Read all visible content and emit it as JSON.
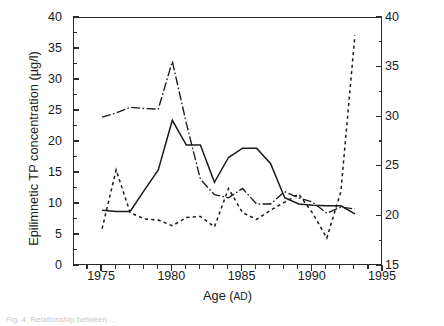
{
  "figure": {
    "caption_partial": "Fig. 4.  Relationship between ..."
  },
  "chart_data": {
    "type": "line",
    "title": "",
    "xlabel": "Age (AD)",
    "xlabel_main": "Age (",
    "xlabel_smallcaps": "AD",
    "xlabel_close": ")",
    "ylabel": "Epilimnetic TP concentration (µg/l)",
    "ylabel_right": "Sediment P concentration (mg/g dry wt)",
    "xlim": [
      1973,
      1995
    ],
    "ylim": [
      0,
      40
    ],
    "ylim_right": [
      15,
      40
    ],
    "grid": false,
    "legend": "none",
    "xticks": [
      1975,
      1980,
      1985,
      1990,
      1995
    ],
    "xticks_minor_step": 1,
    "yticks_left": [
      0,
      5,
      10,
      15,
      20,
      25,
      30,
      35,
      40
    ],
    "yticks_left_minor_step": 2.5,
    "yticks_right": [
      15,
      20,
      25,
      30,
      35,
      40
    ],
    "yticks_right_minor_step": 2.5,
    "series": [
      {
        "name": "Epilimnetic TP (monitored)",
        "axis": "left",
        "style": "solid",
        "color": "#1a1a1a",
        "x": [
          1975,
          1976,
          1977,
          1978,
          1979,
          1980,
          1981,
          1982,
          1983,
          1984,
          1985,
          1986,
          1987,
          1988,
          1989,
          1990,
          1991,
          1992,
          1993
        ],
        "values": [
          9.0,
          8.8,
          8.8,
          12.2,
          15.5,
          23.5,
          19.5,
          19.5,
          13.5,
          17.5,
          19.0,
          19.0,
          16.5,
          11.0,
          10.0,
          9.8,
          9.7,
          9.7,
          8.4
        ]
      },
      {
        "name": "Epilimnetic TP (diatom-inferred)",
        "axis": "left",
        "style": "dash-dot",
        "color": "#1a1a1a",
        "x": [
          1975,
          1976,
          1977,
          1978,
          1979,
          1980,
          1981,
          1982,
          1983,
          1984,
          1985,
          1986,
          1987,
          1988,
          1989,
          1990,
          1991,
          1992,
          1993
        ],
        "values": [
          24.0,
          24.7,
          25.6,
          25.4,
          25.3,
          33.0,
          23.0,
          14.0,
          11.5,
          11.0,
          12.5,
          10.0,
          10.0,
          12.0,
          11.0,
          10.3,
          8.5,
          9.5,
          9.2
        ]
      },
      {
        "name": "Sediment P",
        "axis": "right",
        "style": "dotted",
        "color": "#1a1a1a",
        "x": [
          1975,
          1976,
          1977,
          1978,
          1979,
          1980,
          1981,
          1982,
          1983,
          1984,
          1985,
          1986,
          1987,
          1988,
          1989,
          1990,
          1991,
          1992,
          1993
        ],
        "values_left_scale": [
          6.0,
          15.5,
          8.6,
          7.6,
          7.4,
          6.5,
          7.8,
          8.0,
          6.3,
          12.5,
          8.6,
          7.5,
          9.0,
          10.3,
          11.6,
          8.5,
          4.5,
          12.0,
          37.2
        ],
        "values": [
          18.75,
          24.69,
          20.38,
          19.75,
          19.63,
          19.06,
          19.88,
          20.0,
          18.94,
          22.81,
          20.38,
          19.69,
          20.63,
          21.44,
          22.25,
          20.31,
          17.81,
          22.5,
          38.25
        ]
      }
    ]
  }
}
